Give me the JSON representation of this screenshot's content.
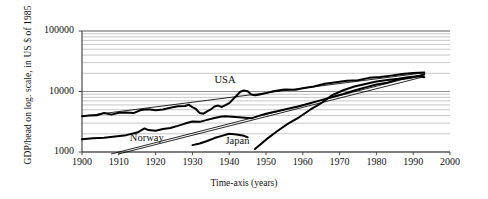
{
  "chart_data": {
    "type": "line",
    "title": "",
    "xlabel": "Time-axis (years)",
    "ylabel": "GDP/head on log. scale, in US $ of 1985",
    "yscale": "log",
    "xlim": [
      1900,
      2000
    ],
    "ylim": [
      1000,
      100000
    ],
    "grid": "horizontal-log-minor",
    "legend_position": "inline-annotations",
    "ytick_labels": [
      "100000",
      "10000",
      "1000"
    ],
    "ytick_values": [
      100000,
      10000,
      1000
    ],
    "xtick_labels": [
      "1900",
      "1910",
      "1920",
      "1930",
      "1940",
      "1950",
      "1960",
      "1970",
      "1980",
      "1990",
      "2000"
    ],
    "xtick_values": [
      1900,
      1910,
      1920,
      1930,
      1940,
      1950,
      1960,
      1970,
      1980,
      1990,
      2000
    ],
    "annotations": [
      {
        "text": "USA",
        "x": 1936,
        "y": 15000
      },
      {
        "text": "Norway",
        "x": 1913,
        "y": 1650
      },
      {
        "text": "Japan",
        "x": 1939,
        "y": 1450
      }
    ],
    "series": [
      {
        "name": "USA",
        "style": "thick-black-line",
        "x": [
          1900,
          1902,
          1904,
          1906,
          1908,
          1910,
          1912,
          1914,
          1916,
          1918,
          1920,
          1922,
          1924,
          1926,
          1928,
          1929,
          1930,
          1931,
          1932,
          1933,
          1934,
          1935,
          1936,
          1937,
          1938,
          1939,
          1940,
          1941,
          1942,
          1943,
          1944,
          1945,
          1946,
          1947,
          1948,
          1950,
          1952,
          1955,
          1958,
          1960,
          1963,
          1966,
          1969,
          1972,
          1975,
          1978,
          1981,
          1984,
          1987,
          1990,
          1993
        ],
        "y": [
          3900,
          4000,
          4050,
          4400,
          4150,
          4450,
          4500,
          4400,
          4950,
          5100,
          4900,
          5050,
          5400,
          5700,
          5750,
          6050,
          5500,
          5100,
          4400,
          4300,
          4700,
          5050,
          5650,
          5850,
          5550,
          5950,
          6400,
          7400,
          8500,
          9900,
          10400,
          10100,
          8900,
          8650,
          8850,
          9400,
          10100,
          10800,
          10700,
          11300,
          12100,
          13400,
          14200,
          15100,
          15300,
          16800,
          17400,
          18300,
          19400,
          20300,
          20600
        ]
      },
      {
        "name": "USA trend",
        "style": "thin-black-line",
        "x": [
          1900,
          1993
        ],
        "y": [
          3900,
          20400
        ]
      },
      {
        "name": "Norway",
        "style": "thick-black-line",
        "x": [
          1900,
          1903,
          1906,
          1909,
          1912,
          1915,
          1917,
          1918,
          1920,
          1922,
          1924,
          1926,
          1928,
          1930,
          1932,
          1934,
          1936,
          1938,
          1939,
          1946,
          1948,
          1950,
          1953,
          1956,
          1959,
          1962,
          1965,
          1968,
          1971,
          1974,
          1977,
          1980,
          1983,
          1986,
          1989,
          1992,
          1993
        ],
        "y": [
          1620,
          1680,
          1720,
          1800,
          1900,
          2100,
          2450,
          2300,
          2250,
          2400,
          2500,
          2700,
          2950,
          3200,
          3150,
          3400,
          3650,
          3850,
          3900,
          3600,
          3950,
          4300,
          4700,
          5200,
          5700,
          6400,
          7200,
          8100,
          9100,
          10400,
          11700,
          13100,
          14000,
          15900,
          16700,
          18300,
          19000
        ]
      },
      {
        "name": "Norway trend",
        "style": "thin-black-line",
        "x": [
          1908,
          1993
        ],
        "y": [
          930,
          19500
        ]
      },
      {
        "name": "Japan prewar",
        "style": "thick-black-line",
        "x": [
          1930,
          1932,
          1934,
          1936,
          1938,
          1940,
          1942,
          1944,
          1945
        ],
        "y": [
          1300,
          1380,
          1520,
          1700,
          1850,
          2000,
          1950,
          1850,
          1750
        ]
      },
      {
        "name": "Japan postwar",
        "style": "thick-black-line",
        "x": [
          1947,
          1950,
          1953,
          1956,
          1959,
          1962,
          1965,
          1968,
          1971,
          1974,
          1977,
          1980,
          1983,
          1986,
          1989,
          1992,
          1993
        ],
        "y": [
          1120,
          1600,
          2200,
          2950,
          3750,
          5000,
          6400,
          8700,
          10500,
          12100,
          13300,
          14600,
          15500,
          16300,
          17400,
          17900,
          17200
        ]
      },
      {
        "name": "Japan trend",
        "style": "thin-black-line",
        "x": [
          1910,
          1993
        ],
        "y": [
          930,
          17600
        ]
      }
    ]
  },
  "axes": {
    "y_axis_name": "gdp-per-head-axis",
    "x_axis_name": "time-axis"
  }
}
